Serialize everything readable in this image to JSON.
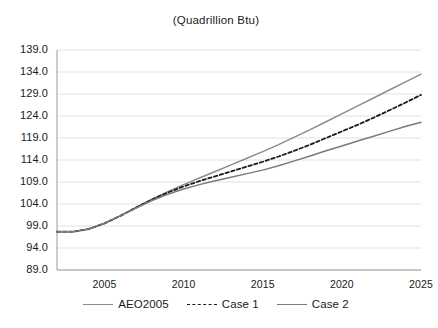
{
  "chart_data": {
    "type": "line",
    "title": "(Quadrillion Btu)",
    "xlabel": "",
    "ylabel": "",
    "xlim": [
      2002,
      2025
    ],
    "ylim": [
      89.0,
      139.0
    ],
    "grid": true,
    "legend_position": "bottom",
    "xticks": [
      "2005",
      "2010",
      "2015",
      "2020",
      "2025"
    ],
    "yticks": [
      "139.0",
      "134.0",
      "129.0",
      "124.0",
      "119.0",
      "114.0",
      "109.0",
      "104.0",
      "99.0",
      "94.0",
      "89.0"
    ],
    "x": [
      2002,
      2003,
      2004,
      2005,
      2006,
      2007,
      2008,
      2009,
      2010,
      2011,
      2012,
      2013,
      2014,
      2015,
      2016,
      2017,
      2018,
      2019,
      2020,
      2021,
      2022,
      2023,
      2024,
      2025
    ],
    "series": [
      {
        "name": "AEO2005",
        "style": "solid",
        "color": "#8c8c8c",
        "values": [
          97.7,
          97.7,
          98.3,
          99.6,
          101.3,
          103.2,
          105.1,
          106.8,
          108.4,
          109.9,
          111.4,
          112.9,
          114.4,
          115.9,
          117.5,
          119.2,
          120.9,
          122.7,
          124.5,
          126.3,
          128.1,
          129.9,
          131.7,
          133.5
        ]
      },
      {
        "name": "Case 1",
        "style": "dashed",
        "color": "#1a1a1a",
        "values": [
          97.7,
          97.7,
          98.3,
          99.6,
          101.3,
          103.2,
          105.0,
          106.6,
          108.0,
          109.2,
          110.3,
          111.4,
          112.5,
          113.6,
          114.8,
          116.1,
          117.5,
          119.0,
          120.5,
          122.0,
          123.6,
          125.3,
          127.0,
          128.8
        ]
      },
      {
        "name": "Case 2",
        "style": "solid",
        "color": "#7a7a7a",
        "values": [
          97.7,
          97.7,
          98.3,
          99.6,
          101.3,
          103.1,
          104.8,
          106.2,
          107.4,
          108.4,
          109.3,
          110.1,
          110.9,
          111.7,
          112.7,
          113.8,
          114.9,
          116.1,
          117.2,
          118.3,
          119.4,
          120.5,
          121.6,
          122.6
        ]
      }
    ]
  },
  "legend": {
    "items": [
      {
        "label": "AEO2005"
      },
      {
        "label": "Case 1"
      },
      {
        "label": "Case 2"
      }
    ]
  }
}
